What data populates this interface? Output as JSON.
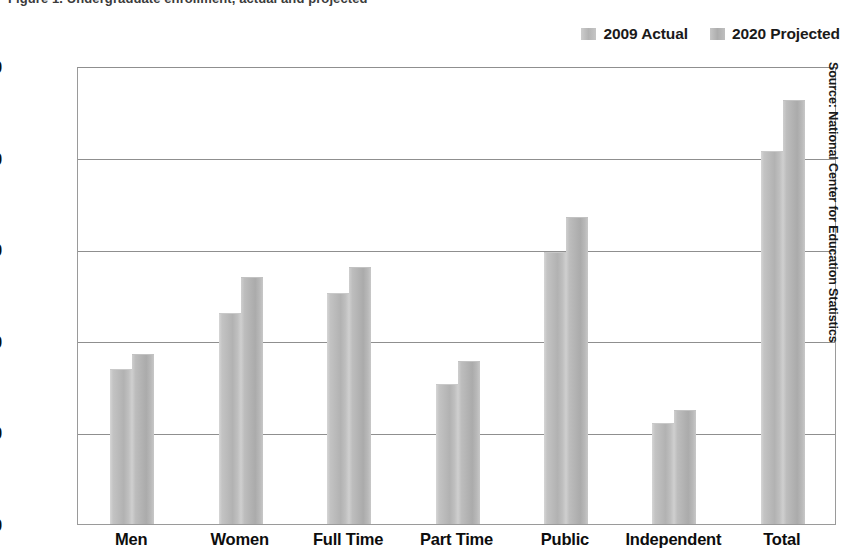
{
  "chart_data": {
    "type": "bar",
    "title": "Figure 1. Undergraduate enrollment, actual and projected",
    "categories": [
      "Men",
      "Women",
      "Full Time",
      "Part Time",
      "Public",
      "Independent",
      "Total"
    ],
    "series": [
      {
        "name": "2009 Actual",
        "color": "#b9b9b9",
        "values": [
          8450,
          11510,
          12600,
          7630,
          14830,
          5510,
          20340
        ]
      },
      {
        "name": "2020 Projected",
        "color": "#b2b2b2",
        "values": [
          9270,
          13470,
          14010,
          8890,
          16740,
          6215,
          23170
        ]
      }
    ],
    "ylabel": "",
    "xlabel": "",
    "ylim": [
      0,
      25000
    ],
    "yticks": [
      0,
      5000,
      10000,
      15000,
      20000,
      25000
    ],
    "ytick_labels": [
      "0",
      "5,000",
      "10,000",
      "15,000",
      "20,000",
      "25,000"
    ],
    "grid": true,
    "legend_position": "top-right",
    "source": "Source: National Center for Education Statistics"
  }
}
